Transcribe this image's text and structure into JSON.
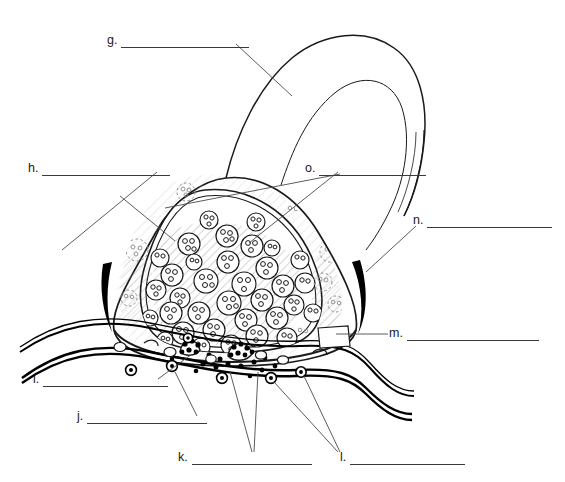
{
  "document": {
    "kind": "worksheet-figure",
    "title": "Synapse / axon terminal unlabeled diagram",
    "background_color": "#ffffff",
    "ink_color": "#1a1a1a",
    "leader_color": "#555555",
    "width": 565,
    "height": 482
  },
  "labels": [
    {
      "id": "g",
      "letter": "g.",
      "answer": "",
      "x": 107,
      "y": 38,
      "blank_width": 128,
      "leader": "from blank end down-right across the axon shaft"
    },
    {
      "id": "h",
      "letter": "h.",
      "answer": "",
      "x": 28,
      "y": 166,
      "blank_width": 128,
      "leader": "from blank end down-right to terminal membrane"
    },
    {
      "id": "o",
      "letter": "o.",
      "answer": "",
      "x": 305,
      "y": 166,
      "blank_width": 107,
      "leader": "two leaders fanning down-left into vesicle field"
    },
    {
      "id": "n",
      "letter": "n.",
      "answer": "",
      "x": 413,
      "y": 218,
      "blank_width": 125,
      "leader": "from blank start down-left to dark membrane arc"
    },
    {
      "id": "m",
      "letter": "m.",
      "answer": "",
      "x": 389,
      "y": 331,
      "blank_width": 132,
      "leader": "from blank start left to membrane notch"
    },
    {
      "id": "i",
      "letter": "i.",
      "answer": "",
      "x": 33,
      "y": 377,
      "blank_width": 125,
      "leader": "from blank end up-right to cleft receptor"
    },
    {
      "id": "j",
      "letter": "j.",
      "answer": "",
      "x": 77,
      "y": 414,
      "blank_width": 120,
      "leader": "from blank end up-right to postsynaptic receptor"
    },
    {
      "id": "k",
      "letter": "k.",
      "answer": "",
      "x": 178,
      "y": 455,
      "blank_width": 120,
      "leader": "two leaders up to transmitter molecules in cleft"
    },
    {
      "id": "l",
      "letter": "l.",
      "answer": "",
      "x": 340,
      "y": 455,
      "blank_width": 115,
      "leader": "two leaders up-left to postsynaptic receptors"
    }
  ],
  "figure": {
    "parts": [
      {
        "name": "axon",
        "description": "curved axon shaft looping at top right"
      },
      {
        "name": "axon-terminal",
        "description": "bulbous presynaptic terminal"
      },
      {
        "name": "synaptic-vesicles",
        "description": "circles containing neurotransmitter dots"
      },
      {
        "name": "mitochondria",
        "description": "hatched organelles inside terminal"
      },
      {
        "name": "presynaptic-membrane",
        "description": "thick dark arcs at terminal base"
      },
      {
        "name": "synaptic-cleft",
        "description": "gap between the two membranes"
      },
      {
        "name": "neurotransmitter-molecules",
        "description": "small filled dots in cleft"
      },
      {
        "name": "postsynaptic-membrane",
        "description": "double-lined membrane below cleft"
      },
      {
        "name": "receptor-sites",
        "description": "small ringed circles on postsynaptic membrane"
      }
    ],
    "vesicle_count_visible": 34,
    "cleft_molecule_count_visible": 26
  }
}
